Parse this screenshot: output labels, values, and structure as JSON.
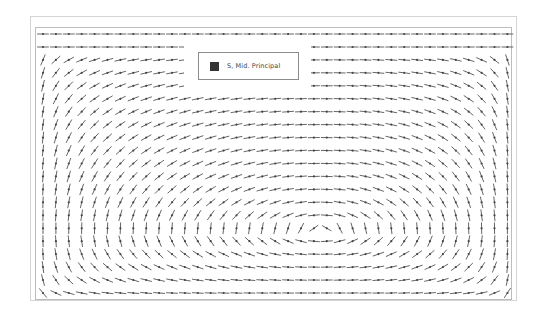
{
  "chart_data": {
    "type": "vector_field",
    "title": "",
    "legend": [
      {
        "label": "S, Mid. Principal",
        "color": "#333333"
      }
    ],
    "glyph": {
      "style": "line-with-center-dot",
      "length_px": 11,
      "color": "#555555"
    },
    "grid": {
      "columns": 37,
      "rows": 21,
      "x_start_px": 43,
      "y_start_px": 34,
      "dx_px": 12.9,
      "dy_px": 12.95
    },
    "vortex_center_px": [
      321,
      230
    ],
    "xlabel": "",
    "ylabel": "",
    "grid_lines": false,
    "legend_position": "upper-center"
  },
  "frame": {
    "outer": {
      "x": 30,
      "y": 16,
      "w": 487,
      "h": 285,
      "color": "#d4d4d4"
    },
    "plot": {
      "x": 35,
      "y": 27,
      "w": 477,
      "h": 273,
      "color": "#bdbdbd"
    }
  },
  "legend": {
    "label": "S, Mid. Principal",
    "swatch_color": "#333333",
    "box": {
      "x": 198,
      "y": 52,
      "w": 101,
      "h": 28
    }
  }
}
